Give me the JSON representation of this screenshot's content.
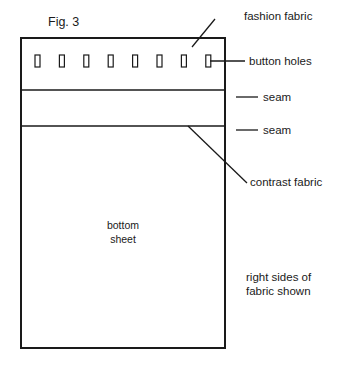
{
  "figure": {
    "title": "Fig. 3",
    "background_color": "#ffffff",
    "ink_color": "#1a1a1a"
  },
  "panel": {
    "name": "fabric-panel",
    "x": 21,
    "y": 38,
    "width": 204,
    "height": 310
  },
  "button_holes": {
    "count": 8,
    "row_y": 55,
    "hole_width": 5,
    "hole_height": 12,
    "first_x": 35,
    "spacing": 24.4
  },
  "seams": [
    {
      "label": "seam",
      "y": 90
    },
    {
      "label": "seam",
      "y": 126
    }
  ],
  "labels": {
    "fashion_fabric": "fashion fabric",
    "button_holes": "button holes",
    "seam_upper": "seam",
    "seam_lower": "seam",
    "contrast_fabric": "contrast fabric"
  },
  "panel_text": {
    "bottom_sheet_line1": "bottom",
    "bottom_sheet_line2": "sheet"
  },
  "note": {
    "line1": "right sides of",
    "line2": "fabric shown"
  }
}
